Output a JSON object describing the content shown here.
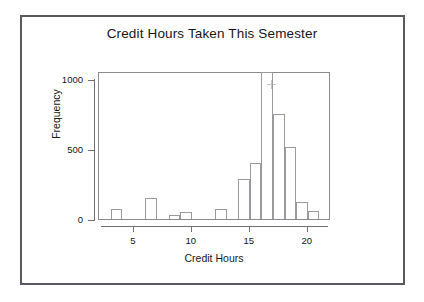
{
  "figure": {
    "frame_color": "#5a5a5e",
    "background": "#ffffff",
    "plot_border_color": "#8c8c90",
    "bar_edge_color": "#9a9a9e",
    "bar_fill_color": "#ffffff",
    "axis_color": "#6f6f74",
    "text_color": "#16161a"
  },
  "chart_data": {
    "type": "bar",
    "subtype": "histogram",
    "title": "Credit Hours Taken This Semester",
    "xlabel": "Credit Hours",
    "ylabel": "Frequency",
    "xlim": [
      2,
      22
    ],
    "ylim": [
      0,
      1060
    ],
    "grid": false,
    "legend": null,
    "bin_width": 1,
    "x_ticks": [
      5,
      10,
      15,
      20
    ],
    "x_tick_labels": [
      "5",
      "10",
      "15",
      "20"
    ],
    "y_ticks": [
      0,
      500,
      1000
    ],
    "y_tick_labels": [
      "0",
      "500",
      "1000"
    ],
    "categories": [
      3,
      6,
      8,
      9,
      12,
      14,
      15,
      16,
      17,
      18,
      19,
      20
    ],
    "values": [
      75,
      150,
      30,
      50,
      70,
      290,
      400,
      1050,
      750,
      515,
      120,
      60
    ],
    "bins": [
      {
        "bin_start": 3,
        "bin_end": 4,
        "frequency": 75
      },
      {
        "bin_start": 6,
        "bin_end": 7,
        "frequency": 150
      },
      {
        "bin_start": 8,
        "bin_end": 9,
        "frequency": 30
      },
      {
        "bin_start": 9,
        "bin_end": 10,
        "frequency": 50
      },
      {
        "bin_start": 12,
        "bin_end": 13,
        "frequency": 70
      },
      {
        "bin_start": 14,
        "bin_end": 15,
        "frequency": 290
      },
      {
        "bin_start": 15,
        "bin_end": 16,
        "frequency": 400
      },
      {
        "bin_start": 16,
        "bin_end": 17,
        "frequency": 1050
      },
      {
        "bin_start": 17,
        "bin_end": 18,
        "frequency": 750
      },
      {
        "bin_start": 18,
        "bin_end": 19,
        "frequency": 515
      },
      {
        "bin_start": 19,
        "bin_end": 20,
        "frequency": 120
      },
      {
        "bin_start": 20,
        "bin_end": 21,
        "frequency": 60
      }
    ],
    "annotations": [
      {
        "name": "stray-plus-marker",
        "x": 16.8,
        "y": 980,
        "glyph": "+"
      }
    ]
  }
}
